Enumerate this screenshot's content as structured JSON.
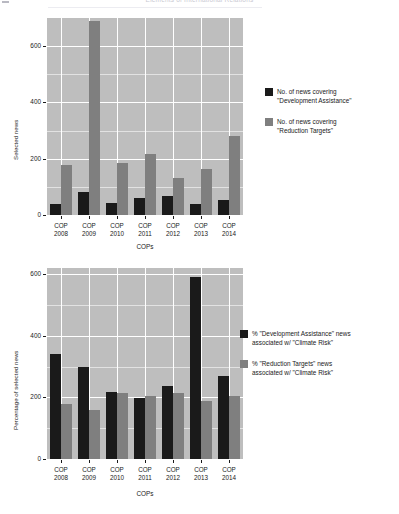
{
  "header": {
    "title": "Elements of International Relations",
    "corner_mark": ""
  },
  "chart_data": [
    {
      "id": "top",
      "type": "bar",
      "title": "",
      "xlabel": "COPs",
      "ylabel": "Selected news",
      "categories": [
        "COP\n2008",
        "COP\n2009",
        "COP\n2010",
        "COP\n2011",
        "COP\n2012",
        "COP\n2013",
        "COP\n2014"
      ],
      "category_lines": [
        [
          "COP",
          "2008"
        ],
        [
          "COP",
          "2009"
        ],
        [
          "COP",
          "2010"
        ],
        [
          "COP",
          "2011"
        ],
        [
          "COP",
          "2012"
        ],
        [
          "COP",
          "2013"
        ],
        [
          "COP",
          "2014"
        ]
      ],
      "ylim": [
        0,
        700
      ],
      "yticks": [
        0,
        200,
        400,
        600
      ],
      "ytick_labels": [
        "0",
        "200",
        "400",
        "600"
      ],
      "grid": true,
      "legend_position": "right",
      "series": [
        {
          "name": "No. of news covering\n\"Development Assistance\"",
          "color": "#1a1a1a",
          "values": [
            40,
            80,
            43,
            60,
            68,
            40,
            55
          ]
        },
        {
          "name": "No. of news covering\n\"Reduction Targets\"",
          "color": "#7f7f7f",
          "values": [
            178,
            690,
            185,
            215,
            133,
            163,
            280
          ]
        }
      ]
    },
    {
      "id": "bottom",
      "type": "bar",
      "title": "",
      "xlabel": "COPs",
      "ylabel": "Percentage of selected news",
      "categories": [
        "COP\n2008",
        "COP\n2009",
        "COP\n2010",
        "COP\n2011",
        "COP\n2012",
        "COP\n2013",
        "COP\n2014"
      ],
      "category_lines": [
        [
          "COP",
          "2008"
        ],
        [
          "COP",
          "2009"
        ],
        [
          "COP",
          "2010"
        ],
        [
          "COP",
          "2011"
        ],
        [
          "COP",
          "2012"
        ],
        [
          "COP",
          "2013"
        ],
        [
          "COP",
          "2014"
        ]
      ],
      "ylim": [
        0,
        620
      ],
      "yticks": [
        0,
        200,
        400,
        600
      ],
      "ytick_labels": [
        "0",
        "200",
        "400",
        "600"
      ],
      "grid": true,
      "legend_position": "right",
      "series": [
        {
          "name": "% \"Development Assistance\" news\nassociated w/ \"Climate Risk\"",
          "color": "#1a1a1a",
          "values": [
            340,
            300,
            216,
            198,
            236,
            590,
            268
          ]
        },
        {
          "name": "% \"Reduction Targets\" news\nassociated w/ \"Climate Risk\"",
          "color": "#7f7f7f",
          "values": [
            178,
            158,
            214,
            206,
            214,
            188,
            206
          ]
        }
      ]
    }
  ]
}
